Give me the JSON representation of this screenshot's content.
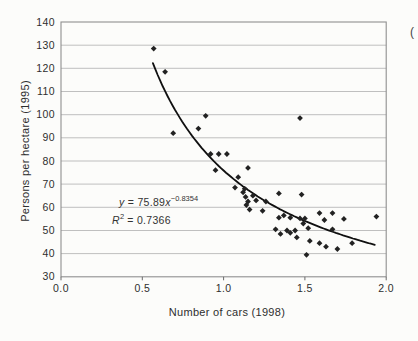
{
  "page": {
    "fragment": "("
  },
  "chart_data": {
    "type": "scatter",
    "title": "",
    "xlabel": "Number of cars (1998)",
    "ylabel": "Persons per hectare (1995)",
    "xlim": [
      0.0,
      2.0
    ],
    "ylim": [
      30,
      140
    ],
    "x_tick_labels": [
      "0.0",
      "0.5",
      "1.0",
      "1.5",
      "2.0"
    ],
    "x_tick_values": [
      0.0,
      0.5,
      1.0,
      1.5,
      2.0
    ],
    "y_tick_labels": [
      "30",
      "40",
      "50",
      "60",
      "70",
      "80",
      "90",
      "100",
      "110",
      "120",
      "130",
      "140"
    ],
    "y_tick_values": [
      30,
      40,
      50,
      60,
      70,
      80,
      90,
      100,
      110,
      120,
      130,
      140
    ],
    "grid": "horizontal",
    "legend": "none",
    "marker": "diamond",
    "points": [
      [
        0.57,
        128.5
      ],
      [
        0.64,
        118.5
      ],
      [
        0.69,
        92
      ],
      [
        0.845,
        94
      ],
      [
        0.89,
        99.5
      ],
      [
        1.47,
        98.5
      ],
      [
        0.92,
        83
      ],
      [
        0.97,
        83
      ],
      [
        1.02,
        83
      ],
      [
        0.95,
        76
      ],
      [
        1.15,
        77
      ],
      [
        1.09,
        73
      ],
      [
        1.07,
        68.5
      ],
      [
        1.13,
        68
      ],
      [
        1.12,
        66.5
      ],
      [
        1.135,
        64.5
      ],
      [
        1.18,
        65
      ],
      [
        1.15,
        62.5
      ],
      [
        1.2,
        63
      ],
      [
        1.14,
        61
      ],
      [
        1.26,
        62.5
      ],
      [
        1.34,
        66
      ],
      [
        1.48,
        65.5
      ],
      [
        1.16,
        59
      ],
      [
        1.24,
        58.5
      ],
      [
        1.34,
        55.5
      ],
      [
        1.37,
        56.5
      ],
      [
        1.41,
        55.5
      ],
      [
        1.47,
        55.2
      ],
      [
        1.5,
        55.2
      ],
      [
        1.49,
        53
      ],
      [
        1.59,
        57.5
      ],
      [
        1.62,
        54.5
      ],
      [
        1.67,
        57.5
      ],
      [
        1.74,
        55
      ],
      [
        1.94,
        56
      ],
      [
        1.32,
        50.5
      ],
      [
        1.39,
        50
      ],
      [
        1.35,
        48.5
      ],
      [
        1.41,
        49
      ],
      [
        1.44,
        50
      ],
      [
        1.45,
        47
      ],
      [
        1.52,
        51
      ],
      [
        1.53,
        45.5
      ],
      [
        1.59,
        44.5
      ],
      [
        1.67,
        50.5
      ],
      [
        1.63,
        43
      ],
      [
        1.7,
        42
      ],
      [
        1.79,
        44.5
      ],
      [
        1.51,
        39.5
      ]
    ],
    "trendline": {
      "type": "power",
      "a": 75.89,
      "b": -0.8354,
      "x_start": 0.565,
      "x_end": 1.935,
      "equation": {
        "lhs": "y",
        "mid": " = 75.89",
        "base": "x",
        "exponent": "−0.8354"
      },
      "r_squared": {
        "lhs": "R",
        "sup": "2",
        "value": " = 0.7366"
      }
    },
    "colors": {
      "marker": "#222222",
      "curve": "#101010",
      "grid": "#b8b8b8",
      "frame": "#8f8f8f",
      "tick": "#6a6a6a",
      "text": "#2e2e2e"
    }
  }
}
